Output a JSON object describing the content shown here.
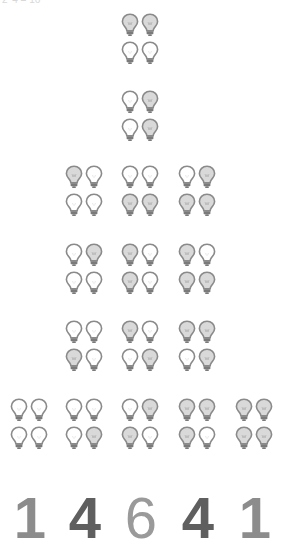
{
  "top_caption": "2^4 = 16",
  "colors": {
    "bulb_outline": "#8a8a8a",
    "bulb_base": "#7a7a7a",
    "bulb_on_fill": "#d9d9d9",
    "bulb_off_fill": "#ffffff",
    "count_colors": [
      "#8c8c8c",
      "#5f5f5f",
      "#9a9a9a",
      "#5f5f5f",
      "#8c8c8c"
    ]
  },
  "bulb_order": [
    "top-left",
    "top-right",
    "bottom-left",
    "bottom-right"
  ],
  "columns": [
    {
      "lit_count": 0,
      "count_label": "1",
      "x": 10,
      "groups": [
        {
          "y": 398,
          "lit": [
            0,
            0,
            0,
            0
          ]
        }
      ]
    },
    {
      "lit_count": 1,
      "count_label": "4",
      "x": 65,
      "groups": [
        {
          "y": 165,
          "lit": [
            1,
            0,
            0,
            0
          ]
        },
        {
          "y": 243,
          "lit": [
            0,
            1,
            0,
            0
          ]
        },
        {
          "y": 320,
          "lit": [
            0,
            0,
            1,
            0
          ]
        },
        {
          "y": 398,
          "lit": [
            0,
            0,
            0,
            1
          ]
        }
      ]
    },
    {
      "lit_count": 2,
      "count_label": "6",
      "x": 121,
      "groups": [
        {
          "y": 13,
          "lit": [
            1,
            1,
            0,
            0
          ]
        },
        {
          "y": 90,
          "lit": [
            0,
            1,
            0,
            1
          ]
        },
        {
          "y": 165,
          "lit": [
            0,
            0,
            1,
            1
          ]
        },
        {
          "y": 243,
          "lit": [
            1,
            0,
            1,
            0
          ]
        },
        {
          "y": 320,
          "lit": [
            1,
            0,
            0,
            1
          ]
        },
        {
          "y": 398,
          "lit": [
            0,
            1,
            1,
            0
          ]
        }
      ]
    },
    {
      "lit_count": 3,
      "count_label": "4",
      "x": 178,
      "groups": [
        {
          "y": 165,
          "lit": [
            0,
            1,
            1,
            1
          ]
        },
        {
          "y": 243,
          "lit": [
            1,
            0,
            1,
            1
          ]
        },
        {
          "y": 320,
          "lit": [
            1,
            1,
            0,
            1
          ]
        },
        {
          "y": 398,
          "lit": [
            1,
            1,
            1,
            0
          ]
        }
      ]
    },
    {
      "lit_count": 4,
      "count_label": "1",
      "x": 235,
      "groups": [
        {
          "y": 398,
          "lit": [
            1,
            1,
            1,
            1
          ]
        }
      ]
    }
  ],
  "counts": [
    "1",
    "4",
    "6",
    "4",
    "1"
  ]
}
